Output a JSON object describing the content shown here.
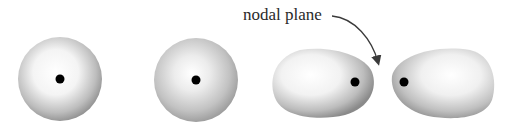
{
  "diagram": {
    "annotation": {
      "label": "nodal plane",
      "icon": "curved-arrow-icon"
    },
    "figures": [
      {
        "name": "spherical-orbital-1",
        "shape": "sphere",
        "nucleus": true
      },
      {
        "name": "spherical-orbital-2",
        "shape": "sphere",
        "nucleus": true
      },
      {
        "name": "lobe-left",
        "shape": "egg",
        "nucleus": true
      },
      {
        "name": "lobe-right",
        "shape": "egg",
        "nucleus": true
      }
    ],
    "colors": {
      "shade_light": "#ffffff",
      "shade_dark": "#8c8c8c",
      "nucleus": "#000000",
      "text": "#2a2a2a"
    }
  }
}
